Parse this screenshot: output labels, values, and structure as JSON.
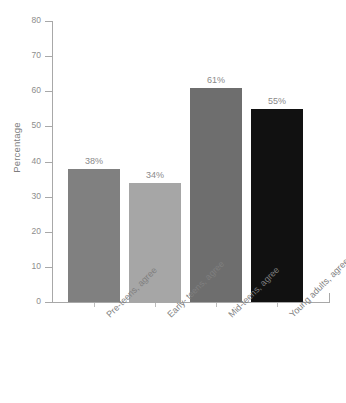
{
  "chart_data": {
    "type": "bar",
    "title": "",
    "xlabel": "",
    "ylabel": "Percentage",
    "ylim": [
      0,
      80
    ],
    "yticks": [
      0,
      10,
      20,
      30,
      40,
      50,
      60,
      70,
      80
    ],
    "grid": false,
    "legend": "none",
    "categories": [
      "Pre-teens, agree",
      "Early- teens, agree",
      "Mid-teens, agree",
      "Young adults, agree"
    ],
    "values": [
      38,
      34,
      61,
      55
    ],
    "value_labels": [
      "38%",
      "34%",
      "61%",
      "55%"
    ],
    "bar_colors": [
      "#808080",
      "#a6a6a6",
      "#6e6e6e",
      "#111111"
    ]
  },
  "axis": {
    "y_title": "Percentage",
    "tick_labels": [
      "80",
      "70",
      "60",
      "50",
      "40",
      "30",
      "20",
      "10",
      "0"
    ]
  },
  "bars": [
    {
      "label": "Pre-teens, agree",
      "value": 38,
      "value_label": "38%",
      "color": "#808080"
    },
    {
      "label": "Early- teens, agree",
      "value": 34,
      "value_label": "34%",
      "color": "#a6a6a6"
    },
    {
      "label": "Mid-teens, agree",
      "value": 61,
      "value_label": "61%",
      "color": "#6e6e6e"
    },
    {
      "label": "Young adults, agree",
      "value": 55,
      "value_label": "55%",
      "color": "#111111"
    }
  ],
  "caption": {
    "text": ""
  }
}
